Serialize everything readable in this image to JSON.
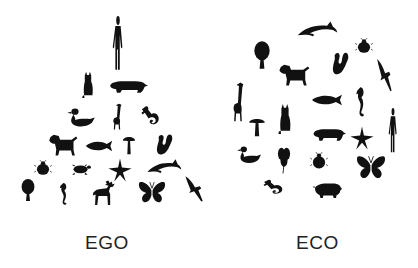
{
  "labels": {
    "left": "EGO",
    "right": "ECO"
  },
  "colors": {
    "silhouette": "#111111",
    "background": "#ffffff",
    "label": "#222222"
  },
  "ego": {
    "arrangement": "pyramid",
    "apex": "human",
    "items": [
      {
        "name": "human",
        "x": 107,
        "y": 16,
        "w": 22,
        "h": 56
      },
      {
        "name": "cat",
        "x": 80,
        "y": 70,
        "w": 16,
        "h": 28
      },
      {
        "name": "bear",
        "x": 106,
        "y": 76,
        "w": 42,
        "h": 20
      },
      {
        "name": "duck",
        "x": 66,
        "y": 106,
        "w": 30,
        "h": 26
      },
      {
        "name": "giraffe",
        "x": 107,
        "y": 102,
        "w": 20,
        "h": 28
      },
      {
        "name": "lizard",
        "x": 140,
        "y": 104,
        "w": 24,
        "h": 26
      },
      {
        "name": "dog",
        "x": 46,
        "y": 132,
        "w": 32,
        "h": 28
      },
      {
        "name": "fish",
        "x": 84,
        "y": 136,
        "w": 30,
        "h": 20
      },
      {
        "name": "mushroom",
        "x": 122,
        "y": 134,
        "w": 14,
        "h": 22
      },
      {
        "name": "squirrel",
        "x": 152,
        "y": 132,
        "w": 22,
        "h": 26
      },
      {
        "name": "ladybug",
        "x": 34,
        "y": 160,
        "w": 18,
        "h": 16
      },
      {
        "name": "turtle",
        "x": 70,
        "y": 160,
        "w": 22,
        "h": 18
      },
      {
        "name": "starfish",
        "x": 108,
        "y": 158,
        "w": 24,
        "h": 24
      },
      {
        "name": "dolphin",
        "x": 146,
        "y": 158,
        "w": 36,
        "h": 22
      },
      {
        "name": "tree",
        "x": 18,
        "y": 178,
        "w": 20,
        "h": 24
      },
      {
        "name": "seahorse",
        "x": 56,
        "y": 182,
        "w": 16,
        "h": 24
      },
      {
        "name": "moose",
        "x": 90,
        "y": 180,
        "w": 28,
        "h": 26
      },
      {
        "name": "butterfly",
        "x": 138,
        "y": 180,
        "w": 28,
        "h": 26
      },
      {
        "name": "bird",
        "x": 184,
        "y": 174,
        "w": 24,
        "h": 28
      }
    ]
  },
  "eco": {
    "arrangement": "circle",
    "items": [
      {
        "name": "dolphin",
        "x": 296,
        "y": 20,
        "w": 42,
        "h": 24
      },
      {
        "name": "ladybug",
        "x": 355,
        "y": 38,
        "w": 18,
        "h": 16
      },
      {
        "name": "tree",
        "x": 250,
        "y": 40,
        "w": 24,
        "h": 30
      },
      {
        "name": "squirrel",
        "x": 328,
        "y": 50,
        "w": 22,
        "h": 28
      },
      {
        "name": "bird",
        "x": 376,
        "y": 56,
        "w": 20,
        "h": 36
      },
      {
        "name": "dog",
        "x": 276,
        "y": 62,
        "w": 34,
        "h": 28
      },
      {
        "name": "giraffe",
        "x": 226,
        "y": 80,
        "w": 24,
        "h": 42
      },
      {
        "name": "fish",
        "x": 310,
        "y": 90,
        "w": 34,
        "h": 20
      },
      {
        "name": "seahorse",
        "x": 352,
        "y": 86,
        "w": 18,
        "h": 32
      },
      {
        "name": "human",
        "x": 384,
        "y": 108,
        "w": 18,
        "h": 46
      },
      {
        "name": "cat",
        "x": 276,
        "y": 102,
        "w": 18,
        "h": 32
      },
      {
        "name": "mushroom",
        "x": 248,
        "y": 116,
        "w": 18,
        "h": 22
      },
      {
        "name": "bear",
        "x": 310,
        "y": 124,
        "w": 36,
        "h": 20
      },
      {
        "name": "starfish",
        "x": 350,
        "y": 126,
        "w": 24,
        "h": 24
      },
      {
        "name": "duck",
        "x": 236,
        "y": 144,
        "w": 26,
        "h": 24
      },
      {
        "name": "clover",
        "x": 276,
        "y": 146,
        "w": 16,
        "h": 28
      },
      {
        "name": "ladybug",
        "x": 310,
        "y": 152,
        "w": 18,
        "h": 18
      },
      {
        "name": "butterfly",
        "x": 356,
        "y": 154,
        "w": 30,
        "h": 28
      },
      {
        "name": "lizard",
        "x": 262,
        "y": 178,
        "w": 26,
        "h": 20
      },
      {
        "name": "pig",
        "x": 312,
        "y": 180,
        "w": 30,
        "h": 20
      }
    ]
  }
}
